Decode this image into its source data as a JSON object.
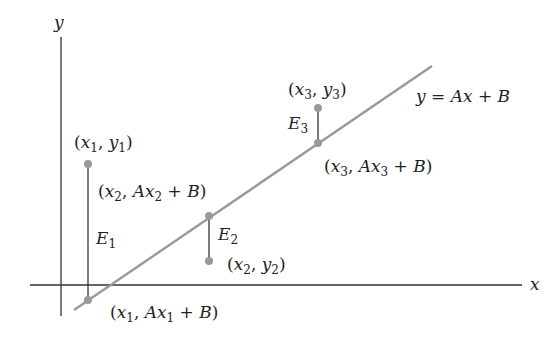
{
  "diagram": {
    "axes": {
      "x_label": "x",
      "y_label": "y"
    },
    "line": {
      "equation": "y = Ax + B",
      "color": "#999999"
    },
    "axis_color": "#333333",
    "point_color": "#999999",
    "points": [
      {
        "data_label": "(x1, y1)",
        "line_label": "(x1, Ax1 + B)",
        "error_label": "E1"
      },
      {
        "data_label": "(x2, y2)",
        "line_label": "(x2, Ax2 + B)",
        "error_label": "E2"
      },
      {
        "data_label": "(x3, y3)",
        "line_label": "(x3, Ax3 + B)",
        "error_label": "E3"
      }
    ]
  },
  "labels": {
    "y_axis": "y",
    "x_axis": "x",
    "equation": {
      "lhs": "y",
      "rhs_a": "A",
      "rhs_x": "x",
      "rhs_b": "B"
    },
    "p1_data": {
      "x": "x",
      "xs": "1",
      "y": "y",
      "ys": "1"
    },
    "p1_line": {
      "x": "x",
      "xs": "1",
      "a": "A",
      "ax": "x",
      "axs": "1",
      "b": "B"
    },
    "p2_data": {
      "x": "x",
      "xs": "2",
      "y": "y",
      "ys": "2"
    },
    "p2_line": {
      "x": "x",
      "xs": "2",
      "a": "A",
      "ax": "x",
      "axs": "2",
      "b": "B"
    },
    "p3_data": {
      "x": "x",
      "xs": "3",
      "y": "y",
      "ys": "3"
    },
    "p3_line": {
      "x": "x",
      "xs": "3",
      "a": "A",
      "ax": "x",
      "axs": "3",
      "b": "B"
    },
    "e1": {
      "e": "E",
      "s": "1"
    },
    "e2": {
      "e": "E",
      "s": "2"
    },
    "e3": {
      "e": "E",
      "s": "3"
    }
  }
}
